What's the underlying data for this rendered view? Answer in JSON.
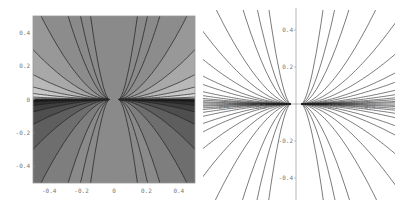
{
  "chart_data": [
    {
      "type": "heatmap",
      "title": "",
      "xlabel": "",
      "ylabel": "",
      "xlim": [
        -0.5,
        0.5
      ],
      "ylim": [
        -0.5,
        0.5
      ],
      "grid": false,
      "frame": true,
      "x_ticks": [
        "-0.4",
        "-0.2",
        "0",
        "0.2",
        "0.4"
      ],
      "y_ticks": [
        "0.4",
        "0.2",
        "0",
        "-0.2",
        "-0.4"
      ],
      "description": "Filled contour plot, grayscale shading; lighter regions above y=0 near the sides, darkest regions just below y=0; contours converge toward points near x=±0.03, y=0",
      "contour_levels_upper": [
        0.05,
        0.12,
        0.25,
        0.5,
        1.0,
        2.0,
        4.5
      ],
      "contour_levels_lower": [
        0.05,
        0.12,
        0.25,
        0.5,
        1.0,
        2.0,
        4.5
      ],
      "colors": {
        "center": "#8a8a8a",
        "upper_bands": [
          "#8c8c8c",
          "#989898",
          "#a8a8a8",
          "#b8b8b8",
          "#c8c8c8",
          "#dadada",
          "#f2f2f2"
        ],
        "lower_bands": [
          "#7e7e7e",
          "#6e6e6e",
          "#5e5e5e",
          "#4e4e4e",
          "#3e3e3e",
          "#2e2e2e",
          "#222222"
        ]
      }
    },
    {
      "type": "line",
      "title": "",
      "xlabel": "",
      "ylabel": "",
      "xlim": [
        -0.5,
        0.5
      ],
      "ylim": [
        -0.5,
        0.5
      ],
      "grid": false,
      "frame": false,
      "axes_through_origin": true,
      "x_ticks": [
        "-0.4",
        "-0.2",
        "0.2",
        "0.4"
      ],
      "y_ticks": [
        "0.4",
        "0.2",
        "-0.2",
        "-0.4"
      ],
      "description": "Contour lines only (no fill); curves fan out from near x=±0.03, y=0, dense near the x-axis",
      "contour_levels": [
        0.02,
        0.04,
        0.07,
        0.1,
        0.15,
        0.22,
        0.35,
        0.5,
        0.8,
        1.3,
        2.2,
        4.5
      ]
    }
  ]
}
